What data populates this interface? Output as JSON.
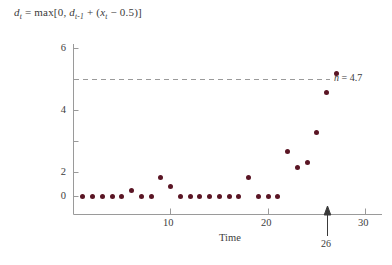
{
  "figure": {
    "formula": {
      "lhs": "d",
      "lhs_sub": "t",
      "eq": " = max[0, ",
      "term1": "d",
      "term1_sub": "t-1",
      "mid": " + (",
      "term2": "x",
      "term2_sub": "t",
      "tail": " − 0.5)]",
      "full_text": "d_t = max[0, d_{t-1} + (x_t − 0.5)]"
    },
    "threshold_label": "h",
    "threshold_eq": " = 4.7",
    "marker_label": "26",
    "colors": {
      "point": "#5a1524",
      "axis": "#9a9a9a",
      "dashed_line": "#9a9a9a",
      "text": "#3a3a3a",
      "background": "#ffffff"
    }
  },
  "chart_data": {
    "type": "scatter",
    "title": "",
    "xlabel": "Time",
    "ylabel": "",
    "xlim": [
      0,
      31
    ],
    "ylim": [
      -0.45,
      6.5
    ],
    "xticks": [
      10,
      20,
      30
    ],
    "xtick_labels": [
      "10",
      "20",
      "30"
    ],
    "yticks": [
      0,
      2,
      4,
      6
    ],
    "ytick_labels": [
      "0",
      "2",
      "4",
      "6"
    ],
    "yminor_ticks": [
      1,
      3,
      5
    ],
    "grid": false,
    "legend": null,
    "annotations": [
      {
        "name": "threshold-line",
        "type": "hline",
        "y": 4.7,
        "label": "h = 4.7",
        "style": "dashed"
      },
      {
        "name": "signal-arrow",
        "type": "arrow-up",
        "x": 26,
        "label": "26"
      }
    ],
    "x": [
      1,
      2,
      3,
      4,
      5,
      6,
      7,
      8,
      9,
      10,
      11,
      12,
      13,
      14,
      15,
      16,
      17,
      18,
      19,
      20,
      21,
      22,
      23,
      24,
      25,
      26,
      27
    ],
    "values": [
      0,
      0,
      0,
      0,
      0,
      0.3,
      0,
      0,
      0.9,
      0.45,
      0,
      0,
      0,
      0,
      0,
      0,
      0,
      0.9,
      0,
      0,
      0,
      2.1,
      1.35,
      1.6,
      3.0,
      4.85,
      5.7
    ],
    "series": [
      {
        "name": "cusum-d",
        "values": [
          0,
          0,
          0,
          0,
          0,
          0.3,
          0,
          0,
          0.9,
          0.45,
          0,
          0,
          0,
          0,
          0,
          0,
          0,
          0.9,
          0,
          0,
          0,
          2.1,
          1.35,
          1.6,
          3.0,
          4.85,
          5.7
        ]
      }
    ]
  }
}
